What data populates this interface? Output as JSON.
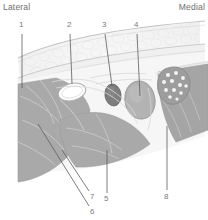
{
  "figure": {
    "type": "anatomical-cross-section",
    "orientation": {
      "left_label": "Lateral",
      "right_label": "Medial"
    },
    "numbered_labels": [
      {
        "id": "1",
        "text": "1",
        "x": 22,
        "y": 27,
        "leader_from": [
          22,
          34
        ],
        "leader_to": [
          22,
          86
        ]
      },
      {
        "id": "2",
        "text": "2",
        "x": 70,
        "y": 27,
        "leader_from": [
          70,
          34
        ],
        "leader_to": [
          72,
          84
        ]
      },
      {
        "id": "3",
        "text": "3",
        "x": 105,
        "y": 27,
        "leader_from": [
          105,
          34
        ],
        "leader_to": [
          112,
          85
        ]
      },
      {
        "id": "4",
        "text": "4",
        "x": 137,
        "y": 27,
        "leader_from": [
          137,
          34
        ],
        "leader_to": [
          140,
          96
        ]
      },
      {
        "id": "5",
        "text": "5",
        "x": 105,
        "y": 197,
        "leader_from": [
          107,
          195
        ],
        "leader_to": [
          107,
          152
        ]
      },
      {
        "id": "6",
        "text": "6",
        "x": 92,
        "y": 211,
        "leader_from": [
          90,
          207
        ],
        "leader_to": [
          38,
          124
        ]
      },
      {
        "id": "7",
        "text": "7",
        "x": 92,
        "y": 196,
        "leader_from": [
          90,
          193
        ],
        "leader_to": [
          62,
          150
        ]
      },
      {
        "id": "8",
        "text": "8",
        "x": 166,
        "y": 196,
        "leader_from": [
          167,
          192
        ],
        "leader_to": [
          167,
          128
        ]
      }
    ],
    "structures": [
      {
        "name": "skin-surface",
        "kind": "outline",
        "color": "#c9c9c9"
      },
      {
        "name": "subcutaneous-fat",
        "kind": "stippled-band",
        "color": "#f2f2f2"
      },
      {
        "name": "deep-fascia",
        "kind": "line",
        "color": "#cccccc"
      },
      {
        "name": "muscle-lateral",
        "kind": "filled-mass",
        "color": "#a9a9a9"
      },
      {
        "name": "muscle-central",
        "kind": "filled-mass",
        "color": "#a9a9a9"
      },
      {
        "name": "muscle-medial",
        "kind": "filled-mass",
        "color": "#a3a3a3"
      },
      {
        "name": "tendon-oval",
        "kind": "hollow-oval",
        "color": "#fbfbfb"
      },
      {
        "name": "artery-small",
        "kind": "filled-oval",
        "color": "#7d7d7d"
      },
      {
        "name": "vessel-large",
        "kind": "filled-oval",
        "color": "#b0b0b0"
      },
      {
        "name": "nerve-fascicles",
        "kind": "teardrop-dots",
        "color": "#9a9a9a"
      }
    ],
    "colors": {
      "background": "#ffffff",
      "label_text": "#7a7a7a",
      "side_label_text": "#6d6d6d",
      "leader_line": "#5a5a5a",
      "outline": "#b4b4b4",
      "muscle_fill": "#a9a9a9",
      "fat_fill": "#f4f4f4",
      "fascia_fill": "#ededed",
      "nerve_fill": "#9a9a9a",
      "artery_fill": "#7d7d7d"
    }
  }
}
